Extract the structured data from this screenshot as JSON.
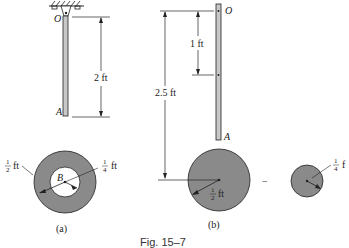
{
  "figure": {
    "caption": "Fig. 15–7",
    "colors": {
      "disk_fill": "#8a8a8a",
      "rod_fill": "#c8c8c8",
      "line": "#222222",
      "background": "#ffffff"
    }
  },
  "panel_a": {
    "label": "(a)",
    "points": {
      "pivot": "O",
      "rod_end": "A",
      "disk_center": "B"
    },
    "dimensions": {
      "rod_length": "2 ft",
      "outer_radius_num": "1",
      "outer_radius_den": "2",
      "outer_radius_unit": "ft",
      "inner_radius_num": "1",
      "inner_radius_den": "4",
      "inner_radius_unit": "ft"
    }
  },
  "panel_b": {
    "label": "(b)",
    "points": {
      "pivot": "O",
      "rod_end": "A"
    },
    "dimensions": {
      "rod_cg": "1 ft",
      "disk_cg": "2.5 ft",
      "big_radius_num": "1",
      "big_radius_den": "2",
      "big_radius_unit": "ft",
      "small_radius_num": "1",
      "small_radius_den": "4",
      "small_radius_unit": "f"
    },
    "operator": "−"
  }
}
